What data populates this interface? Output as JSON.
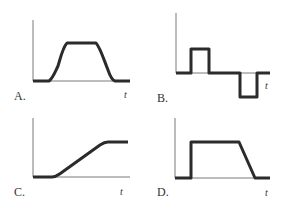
{
  "panels": [
    {
      "id": "A",
      "label": "A.",
      "axis_label": "t",
      "shape": "smooth trapezoidal pulse"
    },
    {
      "id": "B",
      "label": "B.",
      "axis_label": "t",
      "shape": "positive square pulse then negative square pulse"
    },
    {
      "id": "C",
      "label": "C.",
      "axis_label": "t",
      "shape": "ramp up to plateau"
    },
    {
      "id": "D",
      "label": "D.",
      "axis_label": "t",
      "shape": "step up, plateau, linear ramp down"
    }
  ],
  "colors": {
    "curve": "#2b2b2b",
    "axis": "#7a7a7a",
    "text": "#333333",
    "background": "#ffffff"
  }
}
